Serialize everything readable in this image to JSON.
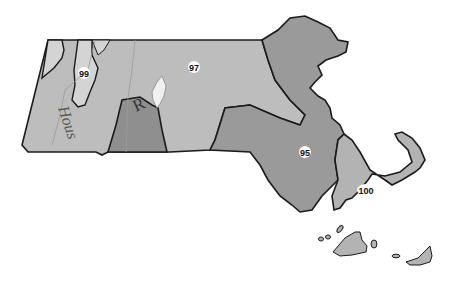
{
  "map": {
    "subject": "Massachusetts",
    "colors": {
      "background": "#ffffff",
      "zone_97": "#bdbdbd",
      "zone_99": "#cfcfcf",
      "zone_95": "#9a9a9a",
      "zone_100": "#b3b3b3",
      "zone_R": "#8f8f8f",
      "outline": "#1a1a1a",
      "label_bg": "#ffffff"
    },
    "regions": [
      {
        "id": "zone-97",
        "label": "97"
      },
      {
        "id": "zone-99",
        "label": "99"
      },
      {
        "id": "zone-95",
        "label": "95"
      },
      {
        "id": "zone-100",
        "label": "100"
      }
    ],
    "annotations": {
      "river": "Hous",
      "inset_letter": "R"
    }
  }
}
